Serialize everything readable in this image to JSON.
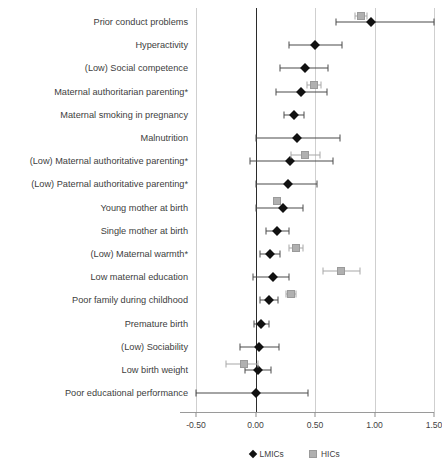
{
  "chart_data": {
    "type": "scatter",
    "orientation": "horizontal-forest-plot",
    "title": "",
    "xlabel": "",
    "ylabel": "",
    "xlim": [
      -0.5,
      1.5
    ],
    "xticks": [
      -0.5,
      0.0,
      0.5,
      1.0,
      1.5
    ],
    "xticklabels": [
      "-0.50",
      "0.00",
      "0.50",
      "1.00",
      "1.50"
    ],
    "grid": true,
    "reference_line": 0.0,
    "legend_position": "bottom",
    "legend": [
      {
        "name": "LMICs",
        "marker": "diamond",
        "color": "#111111"
      },
      {
        "name": "HICs",
        "marker": "square",
        "color": "#b0b0b0"
      }
    ],
    "categories": [
      "Prior conduct problems",
      "Hyperactivity",
      "(Low) Social competence",
      "Maternal authoritarian parenting*",
      "Maternal smoking in pregnancy",
      "Malnutrition",
      "(Low) Maternal authoritative parenting*",
      "(Low) Paternal authoritative parenting*",
      "Young mother at birth",
      "Single mother at birth",
      "(Low) Maternal warmth*",
      "Low maternal education",
      "Poor family during childhood",
      "Premature birth",
      "(Low) Sociability",
      "Low birth weight",
      "Poor educational performance"
    ],
    "series": [
      {
        "name": "LMICs",
        "marker": "diamond",
        "color": "#111111",
        "points": [
          {
            "category": "Prior conduct problems",
            "estimate": 0.97,
            "ci_low": 0.68,
            "ci_high": 1.53
          },
          {
            "category": "Hyperactivity",
            "estimate": 0.5,
            "ci_low": 0.28,
            "ci_high": 0.73
          },
          {
            "category": "(Low) Social competence",
            "estimate": 0.42,
            "ci_low": 0.21,
            "ci_high": 0.61
          },
          {
            "category": "Maternal authoritarian parenting*",
            "estimate": 0.38,
            "ci_low": 0.17,
            "ci_high": 0.6
          },
          {
            "category": "Maternal smoking in pregnancy",
            "estimate": 0.32,
            "ci_low": 0.24,
            "ci_high": 0.41
          },
          {
            "category": "Malnutrition",
            "estimate": 0.35,
            "ci_low": 0.0,
            "ci_high": 0.71
          },
          {
            "category": "(Low) Maternal authoritative parenting*",
            "estimate": 0.29,
            "ci_low": -0.05,
            "ci_high": 0.65
          },
          {
            "category": "(Low) Paternal authoritative parenting*",
            "estimate": 0.27,
            "ci_low": 0.0,
            "ci_high": 0.52
          },
          {
            "category": "Young mother at birth",
            "estimate": 0.23,
            "ci_low": 0.0,
            "ci_high": 0.4
          },
          {
            "category": "Single mother at birth",
            "estimate": 0.18,
            "ci_low": 0.09,
            "ci_high": 0.28
          },
          {
            "category": "(Low) Maternal warmth*",
            "estimate": 0.12,
            "ci_low": 0.04,
            "ci_high": 0.21
          },
          {
            "category": "Low maternal education",
            "estimate": 0.15,
            "ci_low": -0.02,
            "ci_high": 0.28
          },
          {
            "category": "Poor family during childhood",
            "estimate": 0.11,
            "ci_low": 0.04,
            "ci_high": 0.19
          },
          {
            "category": "Premature birth",
            "estimate": 0.05,
            "ci_low": -0.01,
            "ci_high": 0.11
          },
          {
            "category": "(Low) Sociability",
            "estimate": 0.03,
            "ci_low": -0.13,
            "ci_high": 0.2
          },
          {
            "category": "Low birth weight",
            "estimate": 0.02,
            "ci_low": -0.09,
            "ci_high": 0.13
          },
          {
            "category": "Poor educational performance",
            "estimate": 0.0,
            "ci_low": -0.5,
            "ci_high": 0.44
          }
        ]
      },
      {
        "name": "HICs",
        "marker": "square",
        "color": "#b0b0b0",
        "points": [
          {
            "category": "Prior conduct problems",
            "estimate": 0.89,
            "ci_low": 0.84,
            "ci_high": 0.94
          },
          {
            "category": "Maternal authoritarian parenting*",
            "estimate": 0.49,
            "ci_low": 0.43,
            "ci_high": 0.55
          },
          {
            "category": "(Low) Maternal authoritative parenting*",
            "estimate": 0.42,
            "ci_low": 0.3,
            "ci_high": 0.54
          },
          {
            "category": "Young mother at birth",
            "estimate": 0.18,
            "ci_low": 0.16,
            "ci_high": 0.21
          },
          {
            "category": "(Low) Maternal warmth*",
            "estimate": 0.34,
            "ci_low": 0.28,
            "ci_high": 0.4
          },
          {
            "category": "Low maternal education",
            "estimate": 0.72,
            "ci_low": 0.57,
            "ci_high": 0.88
          },
          {
            "category": "Poor family during childhood",
            "estimate": 0.3,
            "ci_low": 0.26,
            "ci_high": 0.34
          },
          {
            "category": "Low birth weight",
            "estimate": -0.1,
            "ci_low": -0.25,
            "ci_high": 0.02
          }
        ]
      }
    ]
  }
}
